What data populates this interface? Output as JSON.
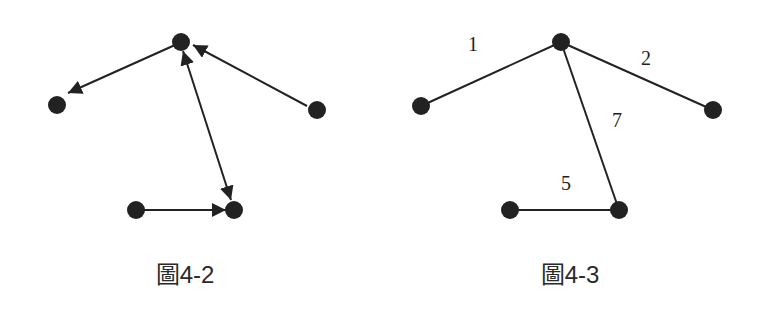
{
  "figures": [
    {
      "caption": "圖4-2",
      "type": "directed-graph",
      "nodes": [
        {
          "id": "A",
          "x": 181,
          "y": 42
        },
        {
          "id": "B",
          "x": 57,
          "y": 105
        },
        {
          "id": "C",
          "x": 317,
          "y": 110
        },
        {
          "id": "D",
          "x": 136,
          "y": 210
        },
        {
          "id": "E",
          "x": 234,
          "y": 210
        }
      ],
      "edges": [
        {
          "from": "A",
          "to": "B",
          "direction": "forward"
        },
        {
          "from": "C",
          "to": "A",
          "direction": "forward"
        },
        {
          "from": "A",
          "to": "E",
          "direction": "both"
        },
        {
          "from": "D",
          "to": "E",
          "direction": "forward"
        }
      ]
    },
    {
      "caption": "圖4-3",
      "type": "weighted-graph",
      "nodes": [
        {
          "id": "A",
          "x": 561,
          "y": 42
        },
        {
          "id": "B",
          "x": 421,
          "y": 106
        },
        {
          "id": "C",
          "x": 713,
          "y": 110
        },
        {
          "id": "D",
          "x": 510,
          "y": 210
        },
        {
          "id": "E",
          "x": 619,
          "y": 210
        }
      ],
      "edges": [
        {
          "from": "A",
          "to": "B",
          "weight": "1"
        },
        {
          "from": "A",
          "to": "C",
          "weight": "2"
        },
        {
          "from": "A",
          "to": "E",
          "weight": "7"
        },
        {
          "from": "D",
          "to": "E",
          "weight": "5"
        }
      ]
    }
  ],
  "colors": {
    "ink": "#222222",
    "background": "#ffffff"
  }
}
